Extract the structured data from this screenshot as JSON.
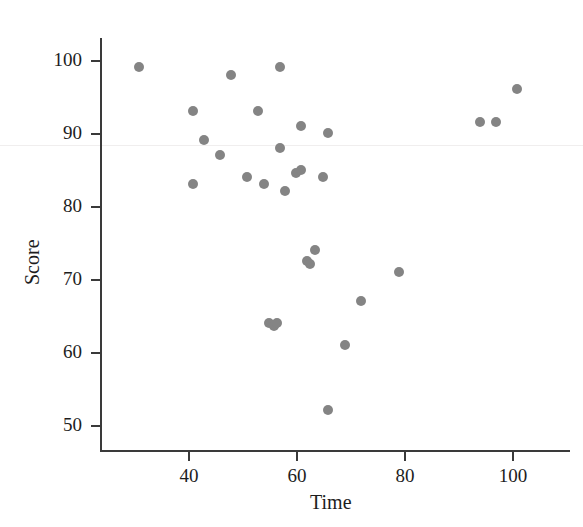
{
  "chart_data": {
    "type": "scatter",
    "title": "",
    "xlabel": "Time",
    "ylabel": "Score",
    "xlim": [
      27,
      108
    ],
    "ylim": [
      48,
      104
    ],
    "xticks": [
      40,
      60,
      80,
      100
    ],
    "yticks": [
      50,
      60,
      70,
      80,
      90,
      100
    ],
    "grid": false,
    "legend": null,
    "marker": {
      "shape": "circle",
      "color": "#848484",
      "size_px": 10
    },
    "series": [
      {
        "name": "observations",
        "points": [
          {
            "x": 31,
            "y": 99
          },
          {
            "x": 41,
            "y": 93
          },
          {
            "x": 41,
            "y": 83
          },
          {
            "x": 43,
            "y": 89
          },
          {
            "x": 46,
            "y": 87
          },
          {
            "x": 48,
            "y": 98
          },
          {
            "x": 51,
            "y": 84
          },
          {
            "x": 53,
            "y": 93
          },
          {
            "x": 54,
            "y": 83
          },
          {
            "x": 55,
            "y": 64
          },
          {
            "x": 56,
            "y": 63.5
          },
          {
            "x": 56.5,
            "y": 64
          },
          {
            "x": 57,
            "y": 88
          },
          {
            "x": 57,
            "y": 99
          },
          {
            "x": 58,
            "y": 82
          },
          {
            "x": 60,
            "y": 84.5
          },
          {
            "x": 61,
            "y": 85
          },
          {
            "x": 61,
            "y": 91
          },
          {
            "x": 62,
            "y": 72.5
          },
          {
            "x": 62.5,
            "y": 72
          },
          {
            "x": 63.5,
            "y": 74
          },
          {
            "x": 65,
            "y": 84
          },
          {
            "x": 66,
            "y": 52
          },
          {
            "x": 66,
            "y": 90
          },
          {
            "x": 69,
            "y": 61
          },
          {
            "x": 72,
            "y": 67
          },
          {
            "x": 79,
            "y": 71
          },
          {
            "x": 94,
            "y": 91.5
          },
          {
            "x": 97,
            "y": 91.5
          },
          {
            "x": 101,
            "y": 96
          }
        ]
      }
    ]
  },
  "axes": {
    "y_title": "Score",
    "x_title": "Time",
    "y_tick_labels": [
      "100",
      "90",
      "80",
      "70",
      "60",
      "50"
    ],
    "x_tick_labels": [
      "40",
      "60",
      "80",
      "100"
    ]
  }
}
